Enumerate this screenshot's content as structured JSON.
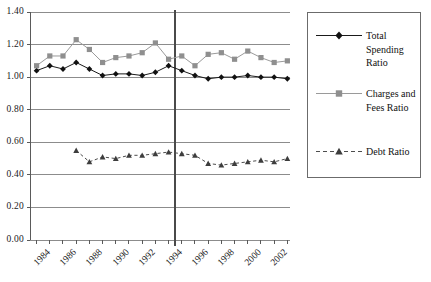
{
  "chart_data": {
    "type": "line",
    "title": "",
    "subtitle": "",
    "xlabel": "",
    "ylabel": "",
    "xlim": [
      1983.5,
      2003.2
    ],
    "ylim": [
      0.0,
      1.4
    ],
    "y_ticks": [
      "0.00",
      "0.20",
      "0.40",
      "0.60",
      "0.80",
      "1.00",
      "1.20",
      "1.40"
    ],
    "y_tick_values": [
      0.0,
      0.2,
      0.4,
      0.6,
      0.8,
      1.0,
      1.2,
      1.4
    ],
    "x_tick_labels": [
      "1984",
      "1986",
      "1988",
      "1990",
      "1992",
      "1994",
      "1996",
      "1998",
      "2000",
      "2002"
    ],
    "x_tick_values": [
      1984,
      1986,
      1988,
      1990,
      1992,
      1994,
      1996,
      1998,
      2000,
      2002
    ],
    "x_minor_ticks": [
      1984,
      1985,
      1986,
      1987,
      1988,
      1989,
      1990,
      1991,
      1992,
      1993,
      1994,
      1995,
      1996,
      1997,
      1998,
      1999,
      2000,
      2001,
      2002,
      2003
    ],
    "grid": "horizontal",
    "legend_position": "right",
    "annotations": [
      {
        "type": "vertical-line",
        "x": 1994.5,
        "label": ""
      }
    ],
    "x": [
      1984,
      1985,
      1986,
      1987,
      1988,
      1989,
      1990,
      1991,
      1992,
      1993,
      1994,
      1995,
      1996,
      1997,
      1998,
      1999,
      2000,
      2001,
      2002,
      2003
    ],
    "series": [
      {
        "name": "Total Spending Ratio",
        "color": "#1a1a1a",
        "marker": "diamond",
        "dash": "solid",
        "values": [
          1.04,
          1.07,
          1.05,
          1.09,
          1.05,
          1.01,
          1.02,
          1.02,
          1.01,
          1.03,
          1.07,
          1.04,
          1.01,
          0.99,
          1.0,
          1.0,
          1.01,
          1.0,
          1.0,
          0.99
        ]
      },
      {
        "name": "Charges and Fees Ratio",
        "color": "#9a9a9a",
        "marker": "square",
        "dash": "solid",
        "values": [
          1.07,
          1.13,
          1.13,
          1.23,
          1.17,
          1.09,
          1.12,
          1.13,
          1.15,
          1.21,
          1.11,
          1.13,
          1.07,
          1.14,
          1.15,
          1.11,
          1.16,
          1.12,
          1.09,
          1.1
        ]
      },
      {
        "name": "Debt Ratio",
        "color": "#4d4d4d",
        "marker": "triangle",
        "dash": "dashed",
        "start_index": 3,
        "values": [
          null,
          null,
          null,
          0.55,
          0.48,
          0.51,
          0.5,
          0.52,
          0.52,
          0.53,
          0.54,
          0.53,
          0.52,
          0.47,
          0.46,
          0.47,
          0.48,
          0.49,
          0.48,
          0.5
        ]
      }
    ]
  },
  "legend": {
    "items": [
      {
        "label": "Total Spending Ratio"
      },
      {
        "label": "Charges and Fees Ratio"
      },
      {
        "label": "Debt Ratio"
      }
    ]
  }
}
